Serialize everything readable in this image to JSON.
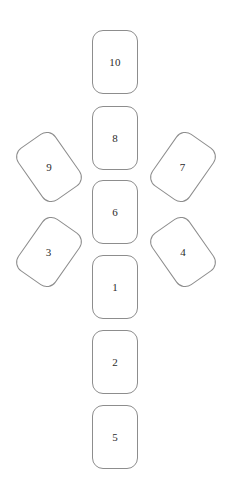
{
  "diagram": {
    "title": "",
    "background_color": "#ffffff",
    "stroke_color": "#8d8d8d",
    "label_color": "#2b2b2b",
    "card_width": 46,
    "card_height": 64,
    "corner_radius": 11,
    "cards": [
      {
        "label": "10",
        "x": 92,
        "y": 30,
        "rotation": 0,
        "column": "center",
        "row": 1
      },
      {
        "label": "8",
        "x": 92,
        "y": 106,
        "rotation": 0,
        "column": "center",
        "row": 2
      },
      {
        "label": "9",
        "x": 26,
        "y": 135,
        "rotation": -35,
        "column": "left",
        "row": 2
      },
      {
        "label": "7",
        "x": 160,
        "y": 135,
        "rotation": 35,
        "column": "right",
        "row": 2
      },
      {
        "label": "6",
        "x": 92,
        "y": 180,
        "rotation": 0,
        "column": "center",
        "row": 3
      },
      {
        "label": "3",
        "x": 26,
        "y": 220,
        "rotation": 35,
        "column": "left",
        "row": 3
      },
      {
        "label": "4",
        "x": 160,
        "y": 220,
        "rotation": -35,
        "column": "right",
        "row": 3
      },
      {
        "label": "1",
        "x": 92,
        "y": 255,
        "rotation": 0,
        "column": "center",
        "row": 4
      },
      {
        "label": "2",
        "x": 92,
        "y": 330,
        "rotation": 0,
        "column": "center",
        "row": 5
      },
      {
        "label": "5",
        "x": 92,
        "y": 405,
        "rotation": 0,
        "column": "center",
        "row": 6
      }
    ]
  }
}
